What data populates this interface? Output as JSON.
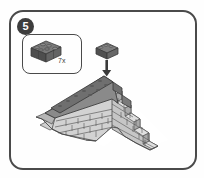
{
  "panel": {
    "step_number": "5",
    "border_color": "#4a4a4a",
    "background_color": "#ffffff"
  },
  "parts_callout": {
    "quantity_label": "7x",
    "part_description": "2x4 brick",
    "part_color": "#555555"
  },
  "placement": {
    "arrow_icon": "arrow-down-icon",
    "floating_brick_label": "2x4 brick",
    "brick_color": "#5a5a5a"
  },
  "model": {
    "name": "stepped brick wall",
    "light_brick_color": "#d4d4d4",
    "mid_brick_color": "#b4b4b4",
    "dark_brick_color": "#8e8e8e",
    "top_course_color": "#6e6e6e",
    "outline_color": "#4a4a4a"
  }
}
